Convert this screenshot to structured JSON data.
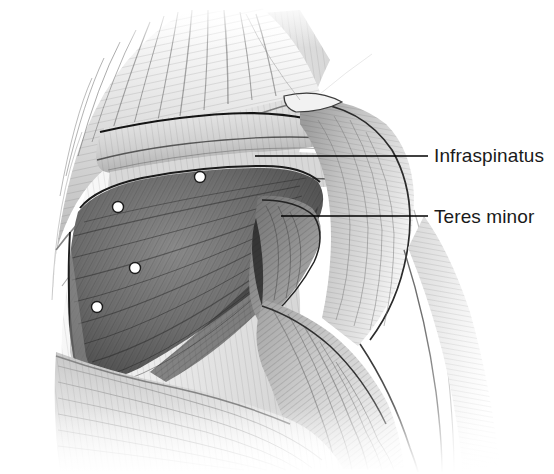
{
  "figure": {
    "background_color": "#ffffff",
    "width": 554,
    "height": 474,
    "style": "grayscale pencil/airbrush medical illustration"
  },
  "labels": [
    {
      "id": "infraspinatus",
      "text": "Infraspinatus",
      "color": "#1a1a1a",
      "font_size": 19,
      "text_x": 434,
      "text_y": 146,
      "leader_line": {
        "x1": 255,
        "y1": 156,
        "x2": 428,
        "y2": 156,
        "color": "#000000",
        "width": 1.6
      }
    },
    {
      "id": "teres-minor",
      "text": "Teres minor",
      "color": "#1a1a1a",
      "font_size": 19,
      "text_x": 434,
      "text_y": 207,
      "leader_line": {
        "x1": 281,
        "y1": 216,
        "x2": 428,
        "y2": 216,
        "color": "#000000",
        "width": 1.6
      }
    }
  ],
  "markers": {
    "description": "white trigger-point dots on the infraspinatus muscle belly",
    "fill": "#ffffff",
    "stroke": "#1b1b1b",
    "radius": 5.5,
    "points": [
      {
        "id": "marker-1",
        "cx": 200,
        "cy": 177
      },
      {
        "id": "marker-2",
        "cx": 118,
        "cy": 207
      },
      {
        "id": "marker-3",
        "cx": 135,
        "cy": 268
      },
      {
        "id": "marker-4",
        "cx": 97,
        "cy": 307
      }
    ]
  },
  "regions": [
    {
      "id": "trapezius",
      "label": "trapezius (upper, unlabeled)",
      "tone": "#c9c9c9"
    },
    {
      "id": "scapular-spine",
      "label": "spine of scapula (unlabeled)",
      "tone": "#d2d2d2"
    },
    {
      "id": "deltoid",
      "label": "deltoid (unlabeled)",
      "tone": "#bdbdbd"
    },
    {
      "id": "infraspinatus-belly",
      "label": "infraspinatus",
      "tone": "#6e6e6e"
    },
    {
      "id": "teres-minor-belly",
      "label": "teres minor",
      "tone": "#8a8a8a"
    },
    {
      "id": "triceps",
      "label": "triceps brachii (unlabeled)",
      "tone": "#c4c4c4"
    },
    {
      "id": "latissimus-dorsi",
      "label": "latissimus dorsi (unlabeled)",
      "tone": "#dcdcdc"
    }
  ]
}
